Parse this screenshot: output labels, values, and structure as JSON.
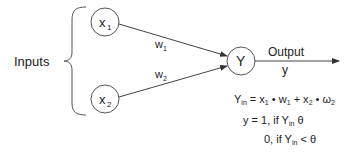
{
  "diagram": {
    "inputs_label": "Inputs",
    "nodes": {
      "x1": {
        "main": "x",
        "sub": "1"
      },
      "x2": {
        "main": "x",
        "sub": "2"
      },
      "y": {
        "main": "Y"
      }
    },
    "weights": {
      "w1": {
        "main": "w",
        "sub": "1"
      },
      "w2": {
        "main": "w",
        "sub": "2"
      }
    },
    "output": {
      "label": "Output",
      "var": "y"
    },
    "equations": {
      "line1": {
        "lhs_main": "Y",
        "lhs_sub": "in",
        "eq": " = x",
        "s1": "1",
        "t1": " • w",
        "s2": "1",
        "t2": " + x",
        "s3": "2",
        "t3": " • ω",
        "s4": "2"
      },
      "line2": {
        "pre": "y = 1, if Y",
        "sub": "in",
        "post": "  θ"
      },
      "line3": {
        "pre": "0, if Y",
        "sub": "in",
        "post": " < θ"
      }
    },
    "colors": {
      "stroke": "#444444",
      "text": "#222222",
      "background": "#ffffff"
    }
  }
}
